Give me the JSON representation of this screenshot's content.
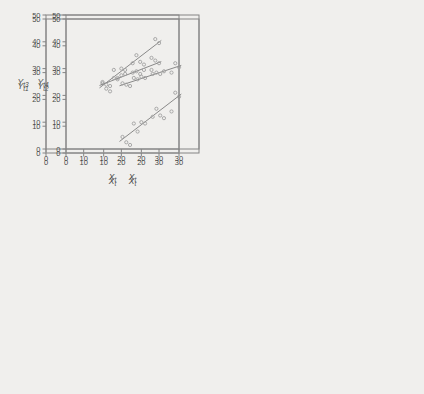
{
  "figure": {
    "xlabel_main": "X",
    "xlabel_sub": "t",
    "x_ticks": [
      "0",
      "10",
      "20",
      "30"
    ],
    "y_ticks": [
      "0",
      "10",
      "20",
      "30",
      "40",
      "50"
    ],
    "colors": {
      "background": "#f0efed",
      "frame": "#848484",
      "tick_text": "#4a4a4a",
      "label_text": "#4a4a4a",
      "point_stroke": "#a0a0a0",
      "fit_line": "#7d7d7d"
    }
  },
  "chart_data": [
    {
      "type": "scatter",
      "panel": "top-left",
      "ylabel": "Y_t1",
      "ylabel_main": "Y",
      "ylabel_sub": "t1",
      "xlabel": "X_t",
      "xlim": [
        0,
        35.3
      ],
      "ylim": [
        0,
        50
      ],
      "marker": "open-circle",
      "x": [
        15,
        16,
        17,
        18,
        19,
        20,
        21,
        23,
        24,
        25,
        26,
        28,
        29,
        30
      ],
      "y": [
        26,
        24,
        23,
        31,
        28,
        31.5,
        31,
        33.5,
        36.5,
        34,
        33,
        35.5,
        42.5,
        41
      ],
      "fit_line": {
        "x1": 14.2,
        "y1": 24.3,
        "x2": 30.6,
        "y2": 42.0
      }
    },
    {
      "type": "scatter",
      "panel": "top-right",
      "ylabel": "Y_t2",
      "ylabel_main": "Y",
      "ylabel_sub": "t2",
      "xlabel": "X_t",
      "xlim": [
        0,
        35.3
      ],
      "ylim": [
        0,
        50
      ],
      "marker": "open-circle",
      "x": [
        15,
        16,
        17,
        18,
        19,
        20,
        21,
        23,
        24,
        25,
        26,
        28,
        29,
        30
      ],
      "y": [
        6,
        4,
        3,
        11,
        8,
        11.5,
        11,
        13.5,
        16.5,
        14,
        13,
        15.5,
        22.5,
        21
      ],
      "fit_line": {
        "x1": 14.2,
        "y1": 4.3,
        "x2": 30.6,
        "y2": 22.0
      }
    },
    {
      "type": "scatter",
      "panel": "bottom-left",
      "ylabel": "Y_t3",
      "ylabel_main": "Y",
      "ylabel_sub": "t3",
      "xlabel": "X_t",
      "xlim": [
        0,
        35.3
      ],
      "ylim": [
        0,
        50
      ],
      "marker": "open-circle",
      "x": [
        15,
        16,
        17,
        18,
        19,
        20,
        21,
        23,
        24,
        25,
        26,
        28,
        29,
        30
      ],
      "y": [
        25,
        24,
        23.5,
        26.5,
        26,
        27.5,
        28,
        28.5,
        29,
        28,
        29.5,
        29.5,
        33,
        32
      ],
      "fit_line": {
        "x1": 14.2,
        "y1": 23.7,
        "x2": 30.6,
        "y2": 32.6
      }
    },
    {
      "type": "scatter",
      "panel": "bottom-right",
      "ylabel": "Y_t4",
      "ylabel_main": "Y",
      "ylabel_sub": "t4",
      "xlabel": "X_t",
      "xlim": [
        0,
        35.3
      ],
      "ylim": [
        0,
        50
      ],
      "marker": "open-circle",
      "x": [
        15,
        16,
        17,
        18,
        19,
        20,
        21,
        23,
        24,
        25,
        26,
        28,
        29,
        30
      ],
      "y": [
        24.5,
        24,
        23.5,
        26.5,
        26,
        27,
        26.5,
        28,
        28.5,
        28,
        29,
        28.5,
        32,
        30.5
      ],
      "fit_line": {
        "x1": 14.2,
        "y1": 23.6,
        "x2": 30.6,
        "y2": 31.2
      }
    }
  ]
}
